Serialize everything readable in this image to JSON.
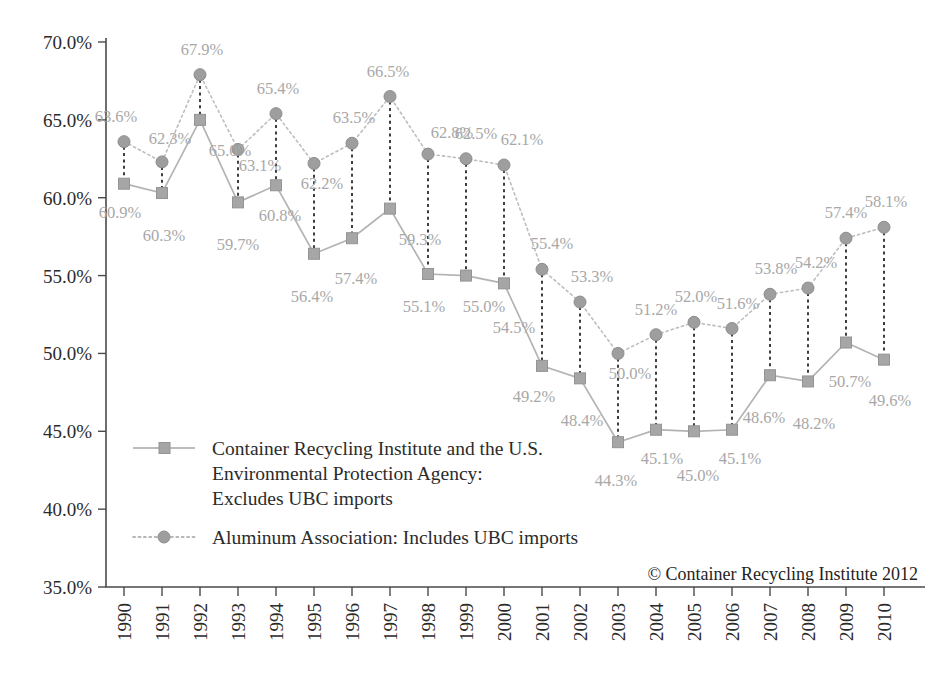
{
  "chart_data": {
    "type": "line",
    "title": "",
    "subtitle": "",
    "xlabel": "",
    "ylabel": "",
    "ylim": [
      35.0,
      70.0
    ],
    "ytick_step": 5.0,
    "grid": false,
    "legend_position": "inside-lower-left",
    "ytick_labels": [
      "70.0%",
      "65.0%",
      "60.0%",
      "55.0%",
      "50.0%",
      "45.0%",
      "40.0%",
      "35.0%"
    ],
    "ytick_values": [
      70.0,
      65.0,
      60.0,
      55.0,
      50.0,
      45.0,
      40.0,
      35.0
    ],
    "categories": [
      "1990",
      "1991",
      "1992",
      "1993",
      "1994",
      "1995",
      "1996",
      "1997",
      "1998",
      "1999",
      "2000",
      "2001",
      "2002",
      "2003",
      "2004",
      "2005",
      "2006",
      "2007",
      "2008",
      "2009",
      "2010"
    ],
    "series": [
      {
        "name": "Container Recycling Institute and the U.S. Environmental Protection Agency: Excludes UBC imports",
        "marker": "square",
        "linestyle": "solid",
        "color": "#a6a6a6",
        "values": [
          60.9,
          60.3,
          65.0,
          59.7,
          60.8,
          56.4,
          57.4,
          59.3,
          55.1,
          55.0,
          54.5,
          49.2,
          48.4,
          44.3,
          45.1,
          45.0,
          45.1,
          48.6,
          48.2,
          50.7,
          49.6
        ],
        "labels": [
          "60.9%",
          "60.3%",
          "65.0%",
          "59.7%",
          "60.8%",
          "56.4%",
          "57.4%",
          "59.3%",
          "55.1%",
          "55.0%",
          "54.5%",
          "49.2%",
          "48.4%",
          "44.3%",
          "45.1%",
          "45.0%",
          "45.1%",
          "48.6%",
          "48.2%",
          "50.7%",
          "49.6%"
        ]
      },
      {
        "name": "Aluminum Association: Includes UBC imports",
        "marker": "circle",
        "linestyle": "dotted",
        "color": "#9e9e9e",
        "values": [
          63.6,
          62.3,
          67.9,
          63.1,
          65.4,
          62.2,
          63.5,
          66.5,
          62.8,
          62.5,
          62.1,
          55.4,
          53.3,
          50.0,
          51.2,
          52.0,
          51.6,
          53.8,
          54.2,
          57.4,
          58.1
        ],
        "labels": [
          "63.6%",
          "62.3%",
          "67.9%",
          "63.1%",
          "65.4%",
          "62.2%",
          "63.5%",
          "66.5%",
          "62.8%",
          "62.5%",
          "62.1%",
          "55.4%",
          "53.3%",
          "50.0%",
          "51.2%",
          "52.0%",
          "51.6%",
          "53.8%",
          "54.2%",
          "57.4%",
          "58.1%"
        ]
      }
    ],
    "annotations": {
      "copyright": "© Container Recycling Institute 2012"
    }
  },
  "legend": {
    "entries": [
      {
        "marker": "square",
        "linestyle": "solid",
        "lines": [
          "Container Recycling Institute and the U.S.",
          "Environmental Protection Agency:",
          "Excludes UBC imports"
        ]
      },
      {
        "marker": "circle",
        "linestyle": "dotted",
        "lines": [
          "Aluminum Association: Includes UBC imports"
        ]
      }
    ]
  },
  "colors": {
    "series_excludes": "#a6a6a6",
    "series_includes": "#9e9e9e",
    "data_label": "#a8a8a8",
    "axis": "#4a4a4a",
    "connector": "#3d3d3d",
    "text": "#2b2b2b",
    "background": "#ffffff"
  },
  "label_offsets": {
    "excludes": [
      {
        "dx": -4,
        "dy": 34,
        "anchor": "middle"
      },
      {
        "dx": 2,
        "dy": 48,
        "anchor": "middle"
      },
      {
        "dx": 30,
        "dy": 36,
        "anchor": "middle"
      },
      {
        "dx": 0,
        "dy": 48,
        "anchor": "middle"
      },
      {
        "dx": 4,
        "dy": 36,
        "anchor": "middle"
      },
      {
        "dx": -2,
        "dy": 48,
        "anchor": "middle"
      },
      {
        "dx": 4,
        "dy": 46,
        "anchor": "middle"
      },
      {
        "dx": 30,
        "dy": 36,
        "anchor": "middle"
      },
      {
        "dx": -4,
        "dy": 38,
        "anchor": "middle"
      },
      {
        "dx": 18,
        "dy": 36,
        "anchor": "middle"
      },
      {
        "dx": 10,
        "dy": 50,
        "anchor": "middle"
      },
      {
        "dx": -8,
        "dy": 36,
        "anchor": "middle"
      },
      {
        "dx": 2,
        "dy": 48,
        "anchor": "middle"
      },
      {
        "dx": -2,
        "dy": 44,
        "anchor": "middle"
      },
      {
        "dx": 6,
        "dy": 34,
        "anchor": "middle"
      },
      {
        "dx": 4,
        "dy": 50,
        "anchor": "middle"
      },
      {
        "dx": 8,
        "dy": 34,
        "anchor": "middle"
      },
      {
        "dx": -6,
        "dy": 48,
        "anchor": "middle"
      },
      {
        "dx": 6,
        "dy": 48,
        "anchor": "middle"
      },
      {
        "dx": 4,
        "dy": 44,
        "anchor": "middle"
      },
      {
        "dx": 6,
        "dy": 46,
        "anchor": "middle"
      }
    ],
    "includes": [
      {
        "dx": -8,
        "dy": -20,
        "anchor": "middle"
      },
      {
        "dx": 8,
        "dy": -18,
        "anchor": "middle"
      },
      {
        "dx": 2,
        "dy": -20,
        "anchor": "middle"
      },
      {
        "dx": 22,
        "dy": 22,
        "anchor": "middle"
      },
      {
        "dx": 2,
        "dy": -20,
        "anchor": "middle"
      },
      {
        "dx": 8,
        "dy": 26,
        "anchor": "middle"
      },
      {
        "dx": 2,
        "dy": -20,
        "anchor": "middle"
      },
      {
        "dx": -2,
        "dy": -20,
        "anchor": "middle"
      },
      {
        "dx": 24,
        "dy": -16,
        "anchor": "middle"
      },
      {
        "dx": 10,
        "dy": -20,
        "anchor": "middle"
      },
      {
        "dx": 18,
        "dy": -20,
        "anchor": "middle"
      },
      {
        "dx": 10,
        "dy": -20,
        "anchor": "middle"
      },
      {
        "dx": 12,
        "dy": -20,
        "anchor": "middle"
      },
      {
        "dx": 12,
        "dy": 26,
        "anchor": "middle"
      },
      {
        "dx": 0,
        "dy": -20,
        "anchor": "middle"
      },
      {
        "dx": 2,
        "dy": -20,
        "anchor": "middle"
      },
      {
        "dx": 6,
        "dy": -20,
        "anchor": "middle"
      },
      {
        "dx": 6,
        "dy": -20,
        "anchor": "middle"
      },
      {
        "dx": 8,
        "dy": -20,
        "anchor": "middle"
      },
      {
        "dx": 0,
        "dy": -20,
        "anchor": "middle"
      },
      {
        "dx": 2,
        "dy": -20,
        "anchor": "middle"
      }
    ]
  }
}
